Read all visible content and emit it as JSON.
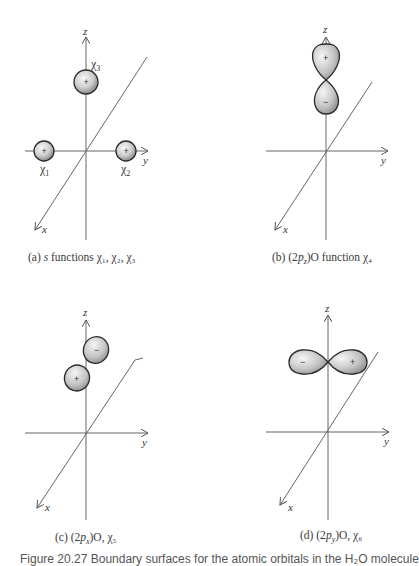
{
  "figure": {
    "caption": "Figure 20.27  Boundary surfaces for the atomic orbitals in the H₂O molecule",
    "panels": [
      {
        "id": "a",
        "label_prefix": "(a) ",
        "label_italic": "s",
        "label_text": " functions χ₁, χ₂, χ₃",
        "axes": {
          "x": "x",
          "y": "y",
          "z": "z"
        },
        "orbitals": [
          {
            "name": "χ₁",
            "sign": "+",
            "type": "s"
          },
          {
            "name": "χ₂",
            "sign": "+",
            "type": "s"
          },
          {
            "name": "χ₃",
            "sign": "+",
            "type": "s"
          }
        ]
      },
      {
        "id": "b",
        "label_prefix": "(b)  (2",
        "label_italic": "p",
        "label_sub": "z",
        "label_text": ")O function χ₄",
        "axes": {
          "x": "x",
          "y": "y",
          "z": "z"
        },
        "lobes": [
          {
            "sign": "+"
          },
          {
            "sign": "−"
          }
        ]
      },
      {
        "id": "c",
        "label_prefix": "(c)  (2",
        "label_italic": "p",
        "label_sub": "x",
        "label_text": ")O, χ₅",
        "axes": {
          "x": "x",
          "y": "y",
          "z": "z"
        },
        "lobes": [
          {
            "sign": "−"
          },
          {
            "sign": "+"
          }
        ]
      },
      {
        "id": "d",
        "label_prefix": "(d)  (2",
        "label_italic": "p",
        "label_sub": "y",
        "label_text": ")O, χ₆",
        "axes": {
          "x": "x",
          "y": "y",
          "z": "z"
        },
        "lobes": [
          {
            "sign": "−"
          },
          {
            "sign": "+"
          }
        ]
      }
    ]
  },
  "colors": {
    "axis": "#555555",
    "outline": "#2a2a2a",
    "shade_light": "#f4f4f4",
    "shade_dark": "#8a8a8a"
  }
}
